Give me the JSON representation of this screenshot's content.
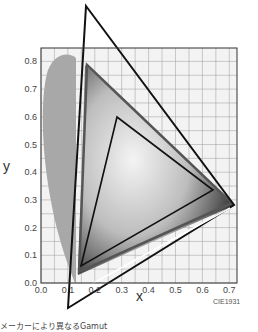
{
  "chart_data": {
    "type": "scatter",
    "title": "",
    "subtitle": "CIE1931",
    "xlabel": "x",
    "ylabel": "y",
    "xlim": [
      0.0,
      0.75
    ],
    "ylim": [
      0.0,
      0.85
    ],
    "grid": true,
    "x_ticks": [
      "0.0",
      "0.1",
      "0.2",
      "0.3",
      "0.4",
      "0.5",
      "0.6",
      "0.7"
    ],
    "y_ticks": [
      "0.0",
      "0.1",
      "0.2",
      "0.3",
      "0.4",
      "0.5",
      "0.6",
      "0.7",
      "0.8"
    ],
    "series": [
      {
        "name": "Spectral locus (visible gamut)",
        "shape": "horseshoe",
        "fill": "#a8a8a8"
      },
      {
        "name": "Large gamut triangle (outer)",
        "points": [
          [
            0.17,
            0.97
          ],
          [
            0.72,
            0.28
          ],
          [
            0.11,
            -0.08
          ]
        ],
        "stroke": "#111111"
      },
      {
        "name": "Wide gamut triangle",
        "points": [
          [
            0.17,
            0.8
          ],
          [
            0.71,
            0.29
          ],
          [
            0.14,
            0.04
          ]
        ],
        "stroke": "#333333"
      },
      {
        "name": "Small gamut triangle (inner)",
        "points": [
          [
            0.28,
            0.6
          ],
          [
            0.64,
            0.33
          ],
          [
            0.15,
            0.06
          ]
        ],
        "stroke": "#111111"
      }
    ],
    "annotations": [
      "CIE1931"
    ]
  },
  "labels": {
    "x_axis": "x",
    "y_axis": "y",
    "diagram_name": "CIE1931",
    "caption": "メーカーにより異なるGamut"
  }
}
